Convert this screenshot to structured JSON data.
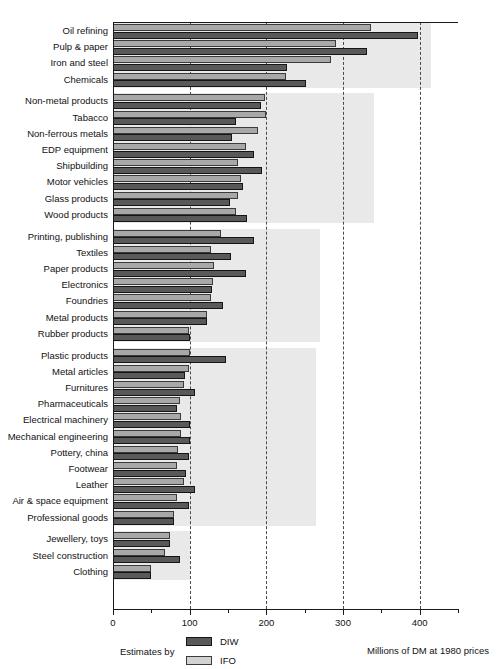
{
  "chart_data": {
    "type": "bar",
    "orientation": "horizontal",
    "title": "",
    "xlabel": "Millions of DM at 1980 prices",
    "ylabel": "",
    "xlim": [
      0,
      450
    ],
    "grid": true,
    "gridlines": [
      100,
      200,
      300,
      400
    ],
    "xticks_major": [
      0,
      100,
      200,
      300,
      400
    ],
    "xtick_labels": [
      "0",
      "100",
      "200",
      "300",
      "400"
    ],
    "xticks_minor": [
      50,
      150,
      250,
      350,
      450
    ],
    "legend_position": "bottom-left",
    "legend_title": "Estimates by",
    "series": [
      {
        "name": "DIW",
        "color": "#595959"
      },
      {
        "name": "IFO",
        "color": "#a8a8a8"
      }
    ],
    "categories": [
      "Oil refining",
      "Pulp & paper",
      "Iron and steel",
      "Chemicals",
      "Non-metal products",
      "Tabacco",
      "Non-ferrous metals",
      "EDP equipment",
      "Shipbuilding",
      "Motor vehicles",
      "Glass products",
      "Wood products",
      "Printing, publishing",
      "Textiles",
      "Paper products",
      "Electronics",
      "Foundries",
      "Metal products",
      "Rubber products",
      "Plastic products",
      "Metal articles",
      "Furnitures",
      "Pharmaceuticals",
      "Electrical machinery",
      "Mechanical engineering",
      "Pottery, china",
      "Footwear",
      "Leather",
      "Air & space equipment",
      "Professional goods",
      "Jewellery, toys",
      "Steel construction",
      "Clothing"
    ],
    "values_DIW": [
      398,
      331,
      227,
      252,
      193,
      161,
      155,
      184,
      194,
      170,
      152,
      175,
      184,
      154,
      173,
      129,
      143,
      122,
      100,
      147,
      94,
      107,
      84,
      101,
      101,
      99,
      95,
      107,
      99,
      80,
      74,
      87,
      50
    ],
    "values_IFO": [
      337,
      291,
      284,
      226,
      198,
      199,
      189,
      174,
      163,
      167,
      163,
      160,
      141,
      128,
      132,
      130,
      128,
      122,
      99,
      100,
      99,
      93,
      87,
      89,
      89,
      85,
      84,
      93,
      83,
      80,
      74,
      68,
      50
    ],
    "groups": [
      {
        "name": "group-1",
        "start": 0,
        "end": 3
      },
      {
        "name": "group-2",
        "start": 4,
        "end": 11
      },
      {
        "name": "group-3",
        "start": 12,
        "end": 18
      },
      {
        "name": "group-4",
        "start": 19,
        "end": 29
      },
      {
        "name": "group-5",
        "start": 30,
        "end": 32
      }
    ],
    "band_extents": [
      415,
      340,
      270,
      265,
      100
    ]
  },
  "legend": {
    "title": "Estimates by",
    "items": [
      {
        "label": "DIW",
        "key": "diw"
      },
      {
        "label": "IFO",
        "key": "ifo"
      }
    ]
  },
  "footer": {
    "units": "Millions of DM at 1980 prices"
  },
  "colors": {
    "diw": "#595959",
    "ifo": "#a8a8a8",
    "band": "#e9e9e9",
    "axis": "#1a1a1a"
  }
}
